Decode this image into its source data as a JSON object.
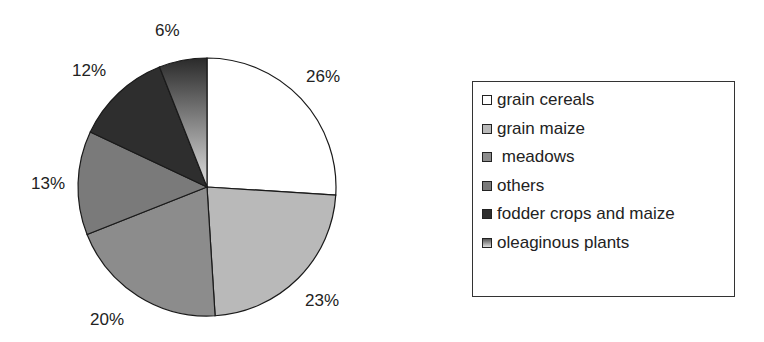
{
  "chart_data": {
    "type": "pie",
    "title": "",
    "categories": [
      "grain cereals",
      "grain maize",
      "meadows",
      "others",
      "fodder crops and maize",
      "oleaginous plants"
    ],
    "values": [
      26,
      23,
      20,
      13,
      12,
      6
    ],
    "labels": [
      "26%",
      "23%",
      "20%",
      "13%",
      "12%",
      "6%"
    ],
    "colors": [
      "#ffffff",
      "#b9b9b9",
      "#8c8c8c",
      "#7a7a7a",
      "#2e2e2e",
      "gradient:#333333-#dddddd"
    ],
    "start_angle_deg": 0,
    "direction": "clockwise",
    "legend_position": "right"
  },
  "legend": {
    "items": [
      {
        "label": "grain cereals",
        "color": "#ffffff"
      },
      {
        "label": "grain maize",
        "color": "#b9b9b9"
      },
      {
        "label": " meadows",
        "color": "#8c8c8c"
      },
      {
        "label": "others",
        "color": "#7a7a7a"
      },
      {
        "label": "fodder crops and maize",
        "color": "#2e2e2e"
      },
      {
        "label": "oleaginous plants",
        "color": "#9a9a9a"
      }
    ]
  },
  "pie_labels": {
    "grain_cereals": "26%",
    "grain_maize": "23%",
    "meadows": "20%",
    "others": "13%",
    "fodder": "12%",
    "oleaginous": "6%"
  }
}
